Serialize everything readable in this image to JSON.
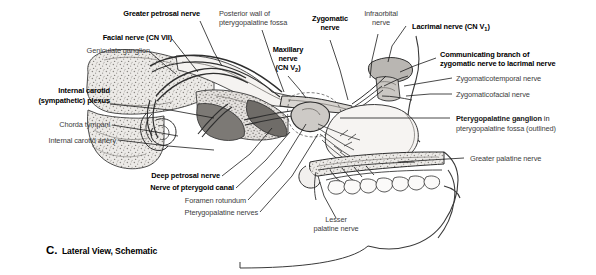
{
  "figure": {
    "caption_letter": "C.",
    "caption_text": "Lateral View, Schematic",
    "view": "Lateral View, Schematic"
  },
  "labels": {
    "greater_petrosal_nerve": "Greater petrosal nerve",
    "facial_nerve": "Facial nerve (CN VII)",
    "geniculate_ganglion": "Geniculate ganglion",
    "posterior_wall_line1": "Posterior wall of",
    "posterior_wall_line2": "pterygopalatine fossa",
    "zygomatic_nerve_line1": "Zygomatic",
    "zygomatic_nerve_line2": "nerve",
    "infraorbital_line1": "Infraorbital",
    "infraorbital_line2": "nerve",
    "maxillary_line1": "Maxillary",
    "maxillary_line2": "nerve",
    "maxillary_line3_pre": "(CN V",
    "maxillary_line3_sub": "2",
    "maxillary_line3_post": ")",
    "lacrimal_pre": "Lacrimal nerve (CN V",
    "lacrimal_sub": "1",
    "lacrimal_post": ")",
    "communicating_line1": "Communicating branch of",
    "communicating_line2": "zygomatic nerve to lacrimal nerve",
    "zygomaticotemporal": "Zygomaticotemporal nerve",
    "zygomaticofacial": "Zygomaticofacial nerve",
    "pterygopalatine_ganglion_bold": "Pterygopalatine ganglion",
    "pterygopalatine_ganglion_rest": " in",
    "pterygopalatine_fossa_line": "pterygopalatine fossa (outlined)",
    "greater_palatine_nerve": "Greater palatine nerve",
    "internal_carotid_line1": "Internal carotid",
    "internal_carotid_line2": "(sympathetic) plexus",
    "chorda_tympani": "Chorda tympani",
    "internal_carotid_artery": "Internal carotid artery",
    "deep_petrosal_nerve": "Deep petrosal nerve",
    "nerve_of_pterygoid_canal": "Nerve of pterygoid canal",
    "foramen_rotundum": "Foramen rotundum",
    "pterygopalatine_nerves": "Pterygopalatine nerves",
    "lesser_palatine_line1": "Lesser",
    "lesser_palatine_line2": "palatine nerve"
  },
  "colors": {
    "ink": "#1a1a1a",
    "gray_text": "#3d3d3d",
    "bone_fill": "#f2f0ee",
    "cancellous_fill": "#dcd9d6",
    "nerve_fill": "#cfcbc7",
    "dark_fill": "#8b8884",
    "line": "#2a2a2a",
    "background": "#ffffff"
  }
}
